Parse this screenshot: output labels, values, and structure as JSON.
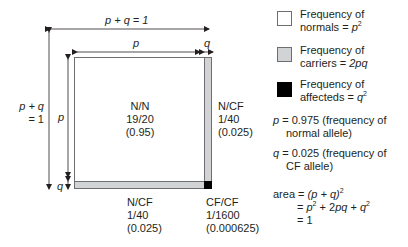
{
  "diagram": {
    "top_label": "p + q = 1",
    "inner_top_p": "p",
    "inner_top_q": "q",
    "left_outer_label_line1": "p + q",
    "left_outer_label_line2": "= 1",
    "left_inner_p": "p",
    "left_inner_q": "q",
    "cells": {
      "nn": {
        "genotype": "N/N",
        "fraction": "19/20",
        "decimal": "(0.95)"
      },
      "right_ncf": {
        "genotype": "N/CF",
        "fraction": "1/40",
        "decimal": "(0.025)"
      },
      "bottom_ncf": {
        "genotype": "N/CF",
        "fraction": "1/40",
        "decimal": "(0.025)"
      },
      "cfcf": {
        "genotype": "CF/CF",
        "fraction": "1/1600",
        "decimal": "(0.000625)"
      }
    },
    "colors": {
      "normal": "#ffffff",
      "carrier": "#d1d3d4",
      "affected": "#000000",
      "line": "#231f20"
    }
  },
  "legend": {
    "items": [
      {
        "line1": "Frequency of",
        "line2_prefix": "normals = ",
        "line2_var": "p",
        "line2_sup": "2",
        "swatch": "white"
      },
      {
        "line1": "Frequency of",
        "line2_prefix": "carriers = ",
        "line2_var": "2pq",
        "line2_sup": "",
        "swatch": "grey"
      },
      {
        "line1": "Frequency of",
        "line2_prefix": "affecteds = ",
        "line2_var": "q",
        "line2_sup": "2",
        "swatch": "black"
      }
    ]
  },
  "notes": {
    "p_var": "p",
    "p_line1": " = 0.975 (frequency of",
    "p_line2": "normal allele)",
    "q_var": "q",
    "q_line1": " = 0.025 (frequency of",
    "q_line2": "CF allele)",
    "area_label": "area = ",
    "area_line1_expr": "(p + q)",
    "area_line1_sup": "2",
    "area_line2_eq": "= ",
    "area_line2_p": "p",
    "area_line2_mid": " + 2",
    "area_line2_pq": "pq",
    "area_line2_plus": " + ",
    "area_line2_q": "q",
    "area_line3": "= 1"
  }
}
